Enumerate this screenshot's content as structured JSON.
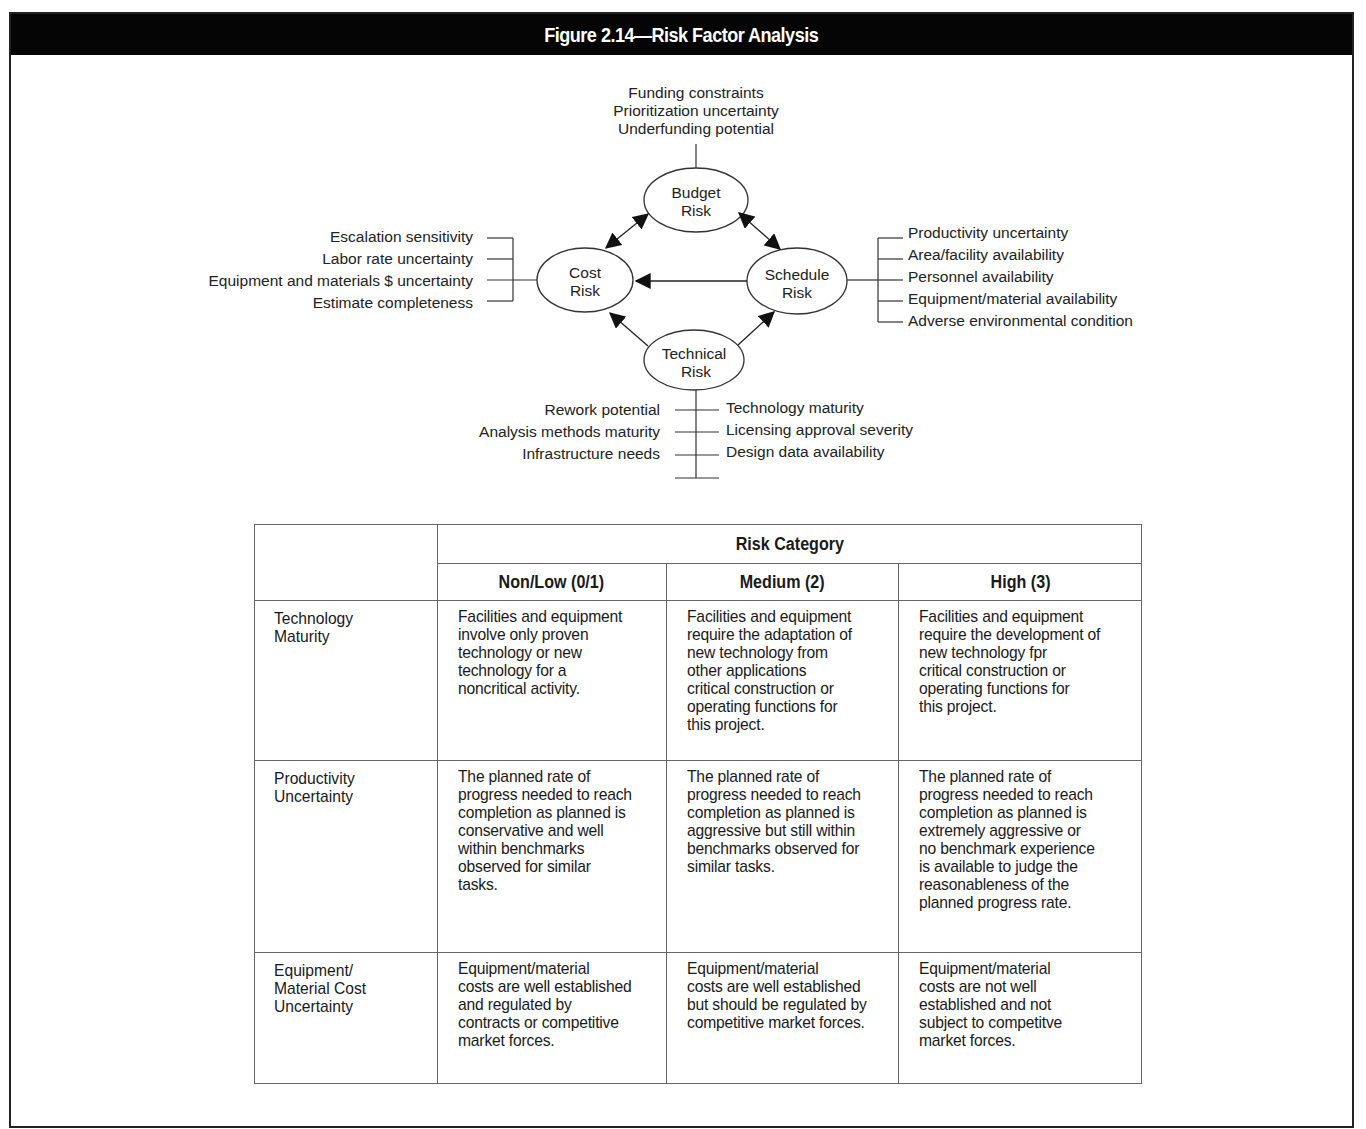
{
  "figure": {
    "title": "Figure 2.14—Risk Factor Analysis"
  },
  "diagram": {
    "nodes": {
      "budget": {
        "line1": "Budget",
        "line2": "Risk"
      },
      "cost": {
        "line1": "Cost",
        "line2": "Risk"
      },
      "schedule": {
        "line1": "Schedule",
        "line2": "Risk"
      },
      "technical": {
        "line1": "Technical",
        "line2": "Risk"
      }
    },
    "budget_factors": [
      "Funding constraints",
      "Prioritization uncertainty",
      "Underfunding potential"
    ],
    "cost_factors": [
      "Escalation sensitivity",
      "Labor rate uncertainty",
      "Equipment and materials $ uncertainty",
      "Estimate completeness"
    ],
    "schedule_factors": [
      "Productivity uncertainty",
      "Area/facility availability",
      "Personnel availability",
      "Equipment/material availability",
      "Adverse environmental condition"
    ],
    "technical_factors_left": [
      "Rework potential",
      "Analysis methods maturity",
      "Infrastructure needs"
    ],
    "technical_factors_right": [
      "Technology maturity",
      "Licensing approval severity",
      "Design data availability"
    ],
    "edges": [
      {
        "from": "budget",
        "to": "cost",
        "type": "bidirectional"
      },
      {
        "from": "budget",
        "to": "schedule",
        "type": "bidirectional"
      },
      {
        "from": "schedule",
        "to": "cost",
        "type": "directed"
      },
      {
        "from": "technical",
        "to": "cost",
        "type": "directed"
      },
      {
        "from": "technical",
        "to": "schedule",
        "type": "directed"
      }
    ]
  },
  "table": {
    "group_header": "Risk Category",
    "columns": [
      "Non/Low (0/1)",
      "Medium (2)",
      "High (3)"
    ],
    "rows": [
      {
        "label": "Technology\nMaturity",
        "cells": [
          "Facilities and equipment\ninvolve only proven\ntechnology or new\ntechnology for a\nnoncritical activity.",
          "Facilities and equipment\nrequire the adaptation of\nnew technology from\nother applications\ncritical construction or\noperating functions for\nthis project.",
          "Facilities and equipment\nrequire the development of\nnew technology fpr\ncritical construction or\noperating functions for\nthis project."
        ]
      },
      {
        "label": "Productivity\nUncertainty",
        "cells": [
          "The planned rate of\nprogress needed to reach\ncompletion as planned is\nconservative and well\nwithin benchmarks\nobserved for similar\ntasks.",
          "The planned rate of\nprogress needed to reach\ncompletion as planned is\naggressive but still within\nbenchmarks observed for\nsimilar tasks.",
          "The planned rate of\nprogress needed to reach\ncompletion as planned is\nextremely aggressive or\nno benchmark experience\nis available to judge the\nreasonableness of the\nplanned progress rate."
        ]
      },
      {
        "label": "Equipment/\nMaterial Cost\nUncertainty",
        "cells": [
          "Equipment/material\ncosts are well established\nand regulated by\ncontracts or competitive\nmarket forces.",
          "Equipment/material\ncosts are well established\nbut should be regulated by\ncompetitive market forces.",
          "Equipment/material\ncosts are not well\nestablished and not\nsubject to competitve\nmarket forces."
        ]
      }
    ]
  }
}
